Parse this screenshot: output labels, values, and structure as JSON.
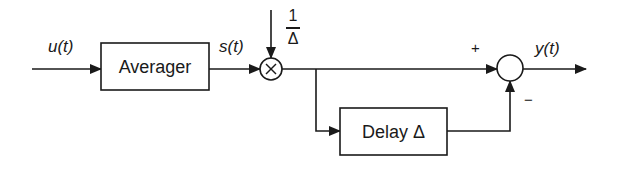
{
  "diagram": {
    "type": "block-diagram",
    "signals": {
      "input": "u(t)",
      "intermediate": "s(t)",
      "output": "y(t)"
    },
    "blocks": [
      {
        "id": "averager",
        "label": "Averager"
      },
      {
        "id": "delay",
        "label": "Delay Δ"
      }
    ],
    "multiplier": {
      "symbol": "×",
      "gain_numerator": "1",
      "gain_denominator": "Δ"
    },
    "summer": {
      "plus_sign": "+",
      "minus_sign": "−"
    },
    "colors": {
      "stroke": "#1a1a1a",
      "background": "#ffffff"
    }
  }
}
